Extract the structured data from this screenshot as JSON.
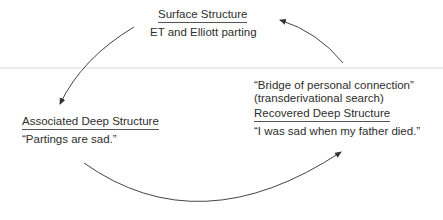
{
  "diagram": {
    "surface": {
      "heading": "Surface Structure",
      "text": "ET and Elliott parting"
    },
    "associated": {
      "heading": "Associated Deep Structure",
      "text": "“Partings are sad.”"
    },
    "bridge": {
      "line1": "“Bridge of personal connection”",
      "line2": "(transderivational search)"
    },
    "recovered": {
      "heading": "Recovered Deep Structure",
      "text": "“I was sad when my father died.”"
    },
    "arrows": [
      {
        "from": "surface",
        "to": "associated"
      },
      {
        "from": "associated",
        "to": "recovered"
      },
      {
        "from": "recovered",
        "to": "surface"
      }
    ],
    "colors": {
      "text": "#2e2e2e",
      "arrow": "#333333",
      "divider": "#ececec"
    }
  }
}
